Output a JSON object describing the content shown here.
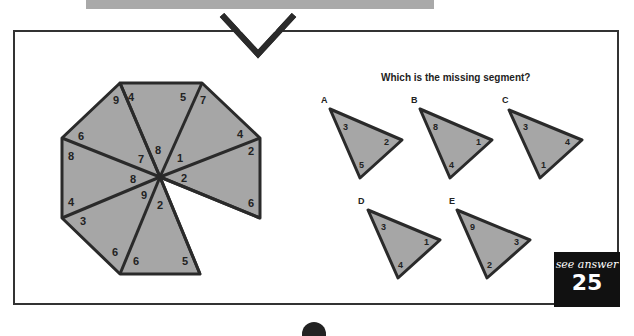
{
  "puzzle": {
    "question": "Which is the missing segment?",
    "octagon_segments": [
      {
        "outer_left": "9",
        "outer_right": "4",
        "inner": "8"
      },
      {
        "outer_left": "5",
        "outer_right": "7",
        "inner": "1"
      },
      {
        "outer_left": "4",
        "outer_right": "2",
        "inner": "2"
      },
      {
        "outer_left": "6",
        "outer_right": "",
        "inner": "missing"
      },
      {
        "outer_left": "6",
        "outer_right": "5",
        "inner": "2"
      },
      {
        "outer_left": "3",
        "outer_right": "6",
        "inner": "9"
      },
      {
        "outer_left": "8",
        "outer_right": "4",
        "inner": "8"
      },
      {
        "outer_left": "6",
        "outer_right": "8",
        "inner": "7"
      }
    ],
    "options": [
      {
        "label": "A",
        "top": "3",
        "right": "2",
        "bottom": "5"
      },
      {
        "label": "B",
        "top": "8",
        "right": "1",
        "bottom": "4"
      },
      {
        "label": "C",
        "top": "3",
        "right": "4",
        "bottom": "1"
      },
      {
        "label": "D",
        "top": "3",
        "right": "1",
        "bottom": "4"
      },
      {
        "label": "E",
        "top": "9",
        "right": "3",
        "bottom": "2"
      }
    ]
  },
  "answer_badge": {
    "text": "see answer",
    "number": "25"
  },
  "colors": {
    "fill": "#a6a6a6",
    "stroke": "#2a2a2a",
    "badge": "#111111"
  }
}
